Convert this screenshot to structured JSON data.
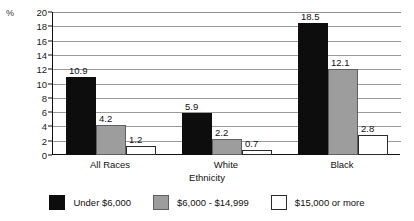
{
  "chart_data": {
    "type": "bar",
    "title": "",
    "xlabel": "Ethnicity",
    "ylabel": "%",
    "ylim": [
      0,
      20
    ],
    "ytick_step": 2,
    "yticks": [
      20,
      18,
      16,
      14,
      12,
      10,
      8,
      6,
      4,
      2,
      0
    ],
    "grid": true,
    "legend_position": "bottom",
    "categories": [
      "All Races",
      "White",
      "Black"
    ],
    "series": [
      {
        "name": "Under $6,000",
        "color": "#0d0d0d",
        "values": [
          10.9,
          5.9,
          18.5
        ],
        "labels": [
          "10.9",
          "5.9",
          "18.5"
        ]
      },
      {
        "name": "$6,000 - $14,999",
        "color": "#9d9d9d",
        "values": [
          4.2,
          2.2,
          12.1
        ],
        "labels": [
          "4.2",
          "2.2",
          "12.1"
        ]
      },
      {
        "name": "$15,000 or more",
        "color": "#ffffff",
        "values": [
          1.2,
          0.7,
          2.8
        ],
        "labels": [
          "1.2",
          "0.7",
          "2.8"
        ]
      }
    ]
  },
  "axis": {
    "percent_symbol": "%",
    "x_title": "Ethnicity"
  },
  "legend": {
    "items": [
      {
        "label": "Under $6,000",
        "swatch": "black"
      },
      {
        "label": "$6,000 - $14,999",
        "swatch": "gray"
      },
      {
        "label": "$15,000 or more",
        "swatch": "white"
      }
    ]
  }
}
